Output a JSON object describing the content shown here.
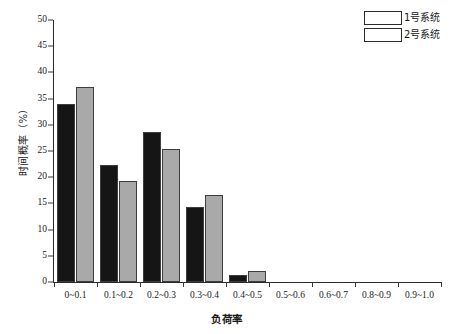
{
  "chart_data": {
    "type": "bar",
    "title": "",
    "subtitle": "",
    "xlabel": "负荷率",
    "ylabel": "时间概率（%）",
    "categories": [
      "0~0.1",
      "0.1~0.2",
      "0.2~0.3",
      "0.3~0.4",
      "0.4~0.5",
      "0.5~0.6",
      "0.6~0.7",
      "0.8~0.9",
      "0.9~1.0"
    ],
    "series": [
      {
        "name": "1号系统",
        "color": "#151515",
        "values": [
          34.0,
          22.3,
          28.7,
          14.3,
          1.3,
          0.0,
          0.0,
          0.0,
          0.0
        ]
      },
      {
        "name": "2号系统",
        "color": "#a9a9a9",
        "values": [
          37.2,
          19.3,
          25.3,
          16.6,
          2.1,
          0.0,
          0.0,
          0.0,
          0.0
        ]
      }
    ],
    "ylim": [
      0,
      50
    ],
    "ytick_values": [
      0,
      5,
      10,
      15,
      20,
      25,
      30,
      35,
      40,
      45,
      50
    ],
    "ytick_labels": [
      "0",
      "5",
      "10",
      "15",
      "20",
      "25",
      "30",
      "35",
      "40",
      "45",
      "50"
    ],
    "grid": false,
    "legend_position": "top-right",
    "legend_entries": [
      {
        "label": "1号系统",
        "color": "#151515"
      },
      {
        "label": "2号系统",
        "color": "#a9a9a9"
      }
    ]
  }
}
